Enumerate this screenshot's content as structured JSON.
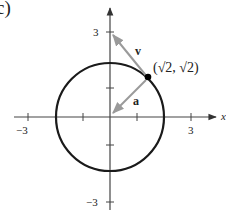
{
  "figure": {
    "part_label": "c)",
    "axis_x_label": "x",
    "axis_y_label": "y",
    "ticks": {
      "x_neg": "−3",
      "x_pos": "3",
      "y_pos": "3",
      "y_neg": "−3"
    },
    "point_label": "(√2, √2)",
    "vector_v_label": "v",
    "vector_a_label": "a",
    "circle_radius": 2,
    "point": [
      1.414,
      1.414
    ],
    "vector_v_end": [
      0,
      3
    ],
    "vector_a_end": [
      0.1,
      0.1
    ],
    "colors": {
      "axis": "#444444",
      "circle": "#1a1a1a",
      "vectors": "#9a9a9a",
      "point": "#000000"
    }
  }
}
